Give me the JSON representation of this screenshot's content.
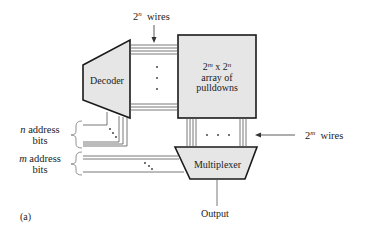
{
  "diagram": {
    "figure_label": "(a)",
    "top_wires": {
      "base": "2",
      "exp": "n",
      "suffix": "wires"
    },
    "right_wires": {
      "base": "2",
      "exp": "m",
      "suffix": "wires"
    },
    "decoder": {
      "label": "Decoder"
    },
    "array": {
      "line1_base_a": "2",
      "line1_exp_a": "m",
      "line1_x": "x",
      "line1_base_b": "2",
      "line1_exp_b": "n",
      "line2": "array of",
      "line3": "pulldowns"
    },
    "multiplexer": {
      "label": "Multiplexer"
    },
    "output": {
      "label": "Output"
    },
    "n_address": {
      "var": "n",
      "line1": "address",
      "line2": "bits"
    },
    "m_address": {
      "var": "m",
      "line1": "address",
      "line2": "bits"
    },
    "colors": {
      "block_fill": "#e6e6e6",
      "stroke": "#1a1a1a",
      "wire": "#555555"
    }
  }
}
